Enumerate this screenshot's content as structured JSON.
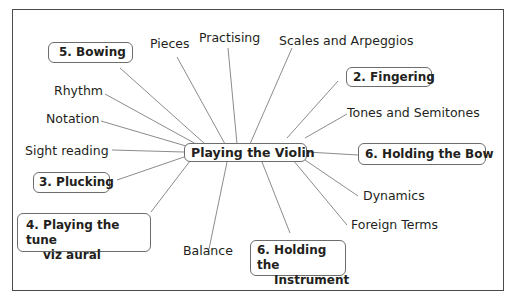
{
  "diagram": {
    "type": "mind-map",
    "center": {
      "label": "Playing the Violin"
    },
    "branches": [
      {
        "id": "bowing",
        "label": "5. Bowing",
        "boxed": true
      },
      {
        "id": "pieces",
        "label": "Pieces",
        "boxed": false
      },
      {
        "id": "practising",
        "label": "Practising",
        "boxed": false
      },
      {
        "id": "scales",
        "label": "Scales and Arpeggios",
        "boxed": false
      },
      {
        "id": "fingering",
        "label": "2. Fingering",
        "boxed": true
      },
      {
        "id": "tones",
        "label": "Tones and Semitones",
        "boxed": false
      },
      {
        "id": "holding-bow",
        "label": "6. Holding the Bow",
        "boxed": true
      },
      {
        "id": "dynamics",
        "label": "Dynamics",
        "boxed": false
      },
      {
        "id": "foreign",
        "label": "Foreign Terms",
        "boxed": false
      },
      {
        "id": "holding-instrument",
        "label_line1": "6. Holding the",
        "label_line2": "Instrument",
        "boxed": true
      },
      {
        "id": "balance",
        "label": "Balance",
        "boxed": false
      },
      {
        "id": "playing-tune",
        "label_line1": "4. Playing the tune",
        "label_line2": "viz aural",
        "boxed": true
      },
      {
        "id": "plucking",
        "label": "3. Plucking",
        "boxed": true
      },
      {
        "id": "sight-reading",
        "label": "Sight reading",
        "boxed": false
      },
      {
        "id": "notation",
        "label": "Notation",
        "boxed": false
      },
      {
        "id": "rhythm",
        "label": "Rhythm",
        "boxed": false
      }
    ]
  }
}
